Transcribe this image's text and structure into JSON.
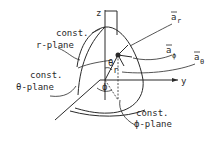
{
  "diagram": {
    "axes": {
      "z": "z",
      "y": "y"
    },
    "surfaces": {
      "r_plane": {
        "line1": "const.",
        "line2": "r-plane"
      },
      "theta_plane": {
        "line1": "const.",
        "line2": "θ-plane"
      },
      "phi_plane": {
        "line1": "const.",
        "line2": "ϕ-plane"
      }
    },
    "unit_vectors": {
      "a_r": {
        "base": "a",
        "sub": "r"
      },
      "a_phi": {
        "base": "a",
        "sub": "ϕ"
      },
      "a_theta": {
        "base": "a",
        "sub": "θ"
      }
    },
    "angles": {
      "theta": "θ",
      "phi": "ϕ",
      "r": "r"
    },
    "colors": {
      "ink": "#2a2a2a",
      "background": "#ffffff"
    }
  }
}
